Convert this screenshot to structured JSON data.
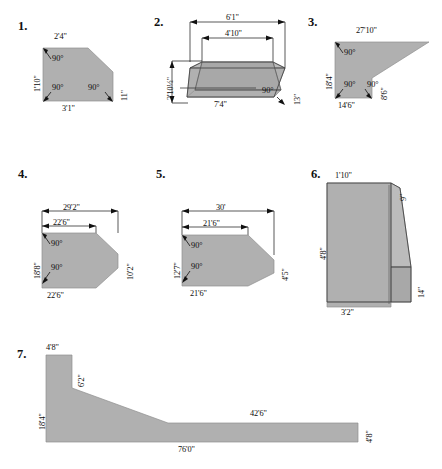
{
  "page": {
    "figure_count": 7,
    "fill_color": "#b0b0b0",
    "line_color": "#111111",
    "background": "#ffffff"
  },
  "figures": [
    {
      "number": "1.",
      "shape": "trapezoid with clipped top-right corner",
      "dimensions": {
        "top": "2'4\"",
        "left": "1'10\"",
        "bottom": "3'1\"",
        "right": "11\""
      },
      "angles": {
        "top_left": "90°",
        "bottom_left": "90°",
        "bottom_right": "90°"
      }
    },
    {
      "number": "2.",
      "shape": "3D trapezoidal prism pan viewed in perspective",
      "dimensions": {
        "outer_top": "6'1\"",
        "inner_top": "4'10\"",
        "left_height": "2'10½\"",
        "bottom": "7'4\"",
        "right_side": "13\""
      },
      "angles": {
        "bottom_right": "90°"
      }
    },
    {
      "number": "3.",
      "shape": "notched polygon with long tapered upper-right wing",
      "dimensions": {
        "top": "27'10\"",
        "left": "18'4\"",
        "bottom": "14'6\"",
        "right_notch": "8'6\""
      },
      "angles": {
        "top_left": "90°",
        "bottom_left": "90°",
        "bottom_right": "90°"
      }
    },
    {
      "number": "4.",
      "shape": "hexagon with beveled right corners",
      "dimensions": {
        "overall_top": "29'2\"",
        "inner_top": "22'6\"",
        "left": "18'8\"",
        "right": "10'2\"",
        "bottom": "22'6\""
      },
      "angles": {
        "top_left": "90°",
        "bottom_left": "90°"
      }
    },
    {
      "number": "5.",
      "shape": "pentagon tapering to a point on the right",
      "dimensions": {
        "overall_top": "30'",
        "inner_top": "21'6\"",
        "left": "12'7\"",
        "right": "4'5\"",
        "bottom": "21'6\""
      },
      "angles": {
        "top_left": "90°",
        "bottom_left": "90°"
      }
    },
    {
      "number": "6.",
      "shape": "3D wedge block with diagonal sloping face",
      "dimensions": {
        "top": "1'10\"",
        "top_right": "9\"",
        "left": "4'8\"",
        "bottom": "3'2\"",
        "right": "14\""
      },
      "angles": {}
    },
    {
      "number": "7.",
      "shape": "long tapered profile ramp section",
      "dimensions": {
        "top_left": "4'8\"",
        "step": "6'2\"",
        "left": "18'4\"",
        "upper_right": "42'6\"",
        "bottom": "76'0\"",
        "right": "4'8\""
      },
      "angles": {}
    }
  ]
}
